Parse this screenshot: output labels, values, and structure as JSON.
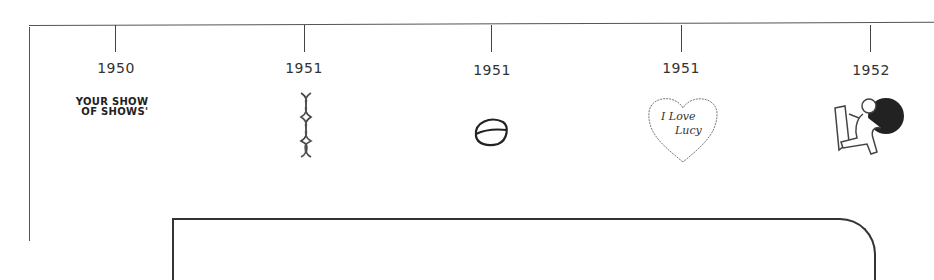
{
  "timeline": {
    "entries": [
      {
        "year": "1950",
        "x": 115,
        "image": "your-show-of-shows-logo",
        "logo_line1": "YOUR SHOW",
        "logo_line2": "OF SHOWS'"
      },
      {
        "year": "1951",
        "x": 304,
        "image": "dna-double-helix-icon"
      },
      {
        "year": "1951",
        "x": 491,
        "image": "pill-capsule-icon"
      },
      {
        "year": "1951",
        "x": 681,
        "image": "i-love-lucy-heart-icon",
        "heart_line1": "I Love",
        "heart_line2": "Lucy"
      },
      {
        "year": "1952",
        "x": 870,
        "image": "heart-transplant-person-icon"
      }
    ]
  }
}
